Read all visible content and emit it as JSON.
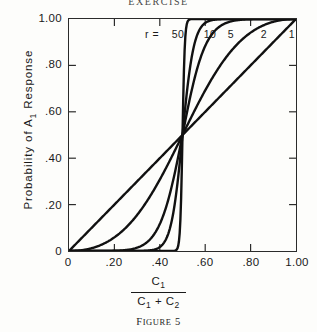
{
  "running_head": "EXERCISE",
  "caption": {
    "prefix": "F",
    "small_caps": "IGURE",
    "number": " 5"
  },
  "axes": {
    "x_ticks": [
      "0",
      ".20",
      ".40",
      ".60",
      ".80",
      "1.00"
    ],
    "y_ticks": [
      "0",
      ".20",
      ".40",
      ".60",
      ".80",
      "1.00"
    ],
    "y_title_pre": "Probability of A",
    "y_title_sub": "1",
    "y_title_post": " Response",
    "x_title_numerator_pre": "C",
    "x_title_numerator_sub": "1",
    "x_title_den_a_pre": "C",
    "x_title_den_a_sub": "1",
    "x_title_den_op": " + ",
    "x_title_den_b_pre": "C",
    "x_title_den_b_sub": "2"
  },
  "legend": {
    "prefix": "r =",
    "entries": [
      "50",
      "10",
      "5",
      "2",
      "1"
    ]
  },
  "colors": {
    "ink": "#1a1a1a",
    "frame": "#2b2b2b",
    "curve": "#111111",
    "background": "#fdfdfb"
  },
  "chart_data": {
    "type": "line",
    "title": "",
    "xlabel": "C1 / (C1 + C2)",
    "ylabel": "Probability of A1 Response",
    "xlim": [
      0,
      1
    ],
    "ylim": [
      0,
      1
    ],
    "grid": false,
    "legend_position": "top-inside",
    "legend_title": "r",
    "x": [
      0,
      0.05,
      0.1,
      0.15,
      0.2,
      0.25,
      0.3,
      0.35,
      0.4,
      0.45,
      0.5,
      0.55,
      0.6,
      0.65,
      0.7,
      0.75,
      0.8,
      0.85,
      0.9,
      0.95,
      1
    ],
    "series": [
      {
        "name": "r = 1",
        "r": 1,
        "values": [
          0,
          0.05,
          0.1,
          0.15,
          0.2,
          0.25,
          0.3,
          0.35,
          0.4,
          0.45,
          0.5,
          0.55,
          0.6,
          0.65,
          0.7,
          0.75,
          0.8,
          0.85,
          0.9,
          0.95,
          1
        ]
      },
      {
        "name": "r = 2",
        "r": 2,
        "values": [
          0,
          0.0027,
          0.0122,
          0.0305,
          0.0588,
          0.1,
          0.1552,
          0.2249,
          0.3077,
          0.4008,
          0.5,
          0.5992,
          0.6923,
          0.7751,
          0.8448,
          0.9,
          0.9412,
          0.9695,
          0.9878,
          0.9972,
          1
        ]
      },
      {
        "name": "r = 5",
        "r": 5,
        "values": [
          0,
          0.0,
          0.0,
          0.0003,
          0.0015,
          0.0058,
          0.018,
          0.0472,
          0.1052,
          0.2007,
          0.5,
          0.7993,
          0.8948,
          0.9528,
          0.982,
          0.9942,
          0.9985,
          0.9997,
          1,
          1,
          1
        ]
      },
      {
        "name": "r = 10",
        "r": 10,
        "values": [
          0,
          0,
          0,
          0,
          0,
          0,
          0,
          0.0022,
          0.0137,
          0.0585,
          0.5,
          0.9415,
          0.9863,
          0.9978,
          0.9997,
          1,
          1,
          1,
          1,
          1,
          1
        ]
      },
      {
        "name": "r = 50",
        "r": 50,
        "values": [
          0,
          0,
          0,
          0,
          0,
          0,
          0,
          0,
          0,
          0.0001,
          0.5,
          0.9999,
          1,
          1,
          1,
          1,
          1,
          1,
          1,
          1,
          1
        ]
      }
    ]
  }
}
